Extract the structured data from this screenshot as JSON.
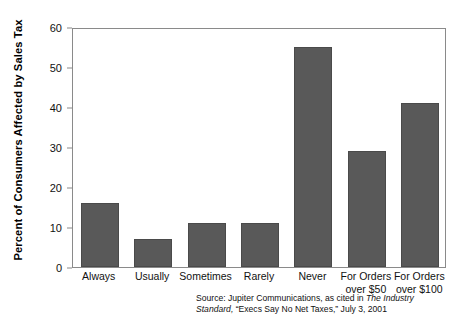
{
  "chart_data": {
    "type": "bar",
    "title": "",
    "subtitle": "",
    "xlabel": "",
    "ylabel": "Percent of Consumers Affected by Sales Tax",
    "ylim": [
      0,
      60
    ],
    "yticks": [
      0,
      10,
      20,
      30,
      40,
      50,
      60
    ],
    "ytick_labels": [
      "0",
      "10",
      "20",
      "30",
      "40",
      "50",
      "60"
    ],
    "grid": false,
    "legend": null,
    "legend_position": "none",
    "bar_color": "#595959",
    "frame_color": "#8a8a8a",
    "categories": [
      "Always",
      "Usually",
      "Sometimes",
      "Rarely",
      "Never",
      "For Orders over $50",
      "For Orders over $100"
    ],
    "category_lines": [
      [
        "Always",
        ""
      ],
      [
        "Usually",
        ""
      ],
      [
        "Sometimes",
        ""
      ],
      [
        "Rarely",
        ""
      ],
      [
        "Never",
        ""
      ],
      [
        "For Orders",
        "over $50"
      ],
      [
        "For Orders",
        "over $100"
      ]
    ],
    "values": [
      16,
      7,
      11,
      11,
      55,
      29,
      41
    ],
    "annotations": []
  },
  "source": {
    "line1_prefix": "Source: Jupiter Communications, as cited in ",
    "line1_italic": "The Industry",
    "line2_italic": "Standard,",
    "line2_rest": " “Execs Say No Net Taxes,” July 3, 2001"
  }
}
